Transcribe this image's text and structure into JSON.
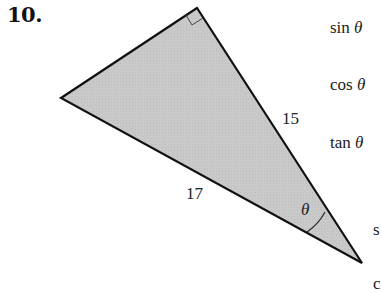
{
  "problem": {
    "number": "10."
  },
  "figure": {
    "type": "right-triangle",
    "fill_color": "#c8c8c8",
    "stroke_color": "#111111",
    "vertices": {
      "right_angle": [
        197,
        8
      ],
      "left": [
        61,
        98
      ],
      "theta_vertex": [
        362,
        263
      ]
    },
    "labels": {
      "side_right": "15",
      "hypotenuse": "17",
      "angle": "θ"
    }
  },
  "trig_functions": [
    {
      "fn": "sin",
      "var": "θ"
    },
    {
      "fn": "cos",
      "var": "θ"
    },
    {
      "fn": "tan",
      "var": "θ"
    }
  ],
  "cutoff_text": {
    "s": "s",
    "c": "c"
  }
}
